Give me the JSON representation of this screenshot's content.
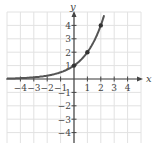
{
  "chart_data": {
    "type": "line",
    "title": "",
    "function": "y = 2^x",
    "xlabel": "x",
    "ylabel": "y",
    "xlim": [
      -5,
      5
    ],
    "ylim": [
      -5,
      5
    ],
    "grid": true,
    "x_ticks": [
      "-4",
      "-3",
      "-2",
      "-1",
      "1",
      "2",
      "3",
      "4"
    ],
    "y_ticks": [
      "4",
      "3",
      "2",
      "1",
      "-1",
      "-2",
      "-3",
      "-4"
    ],
    "points": [
      {
        "x": 0,
        "y": 1
      },
      {
        "x": 1,
        "y": 2
      },
      {
        "x": 2,
        "y": 4
      }
    ],
    "curve_x": [
      -5,
      -4,
      -3,
      -2,
      -1,
      0,
      1,
      2,
      2.2
    ],
    "curve_y": [
      0.031,
      0.0625,
      0.125,
      0.25,
      0.5,
      1,
      2,
      4,
      4.59
    ],
    "curve_color": "#555555"
  }
}
